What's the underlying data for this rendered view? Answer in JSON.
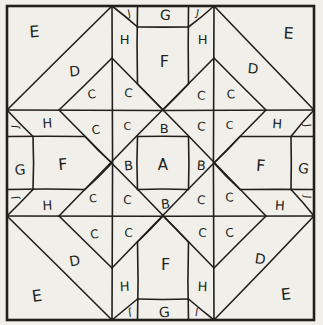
{
  "diagram": {
    "type": "quilt-block-piecing-diagram",
    "letters_used": [
      "A",
      "B",
      "C",
      "D",
      "E",
      "F",
      "G",
      "H",
      "J"
    ],
    "colors": {
      "paper": "#f1efe9",
      "ink": "#211f1c"
    },
    "stroke": {
      "border_width": 2.6,
      "line_width": 1.6
    },
    "grid": {
      "x": [
        7,
        33,
        59,
        85,
        112,
        137.5,
        163,
        188.5,
        214,
        240,
        266,
        291,
        314
      ],
      "y": [
        6,
        27,
        58,
        84,
        110,
        136.5,
        163,
        189.5,
        216,
        242,
        268,
        299,
        320
      ]
    },
    "segments": [
      [
        4,
        0,
        4,
        12
      ],
      [
        8,
        0,
        8,
        12
      ],
      [
        0,
        4,
        12,
        4
      ],
      [
        0,
        8,
        12,
        8
      ],
      [
        4,
        0,
        0,
        4
      ],
      [
        8,
        0,
        12,
        4
      ],
      [
        0,
        8,
        4,
        12
      ],
      [
        12,
        8,
        8,
        12
      ],
      [
        4,
        2,
        10,
        8
      ],
      [
        2,
        4,
        8,
        10
      ],
      [
        8,
        2,
        2,
        8
      ],
      [
        10,
        4,
        4,
        10
      ],
      [
        2,
        4,
        4,
        2
      ],
      [
        8,
        2,
        10,
        4
      ],
      [
        2,
        8,
        4,
        10
      ],
      [
        8,
        10,
        10,
        8
      ],
      [
        5,
        5,
        7,
        5
      ],
      [
        7,
        5,
        7,
        7
      ],
      [
        5,
        7,
        7,
        7
      ],
      [
        5,
        5,
        5,
        7
      ],
      [
        5,
        0,
        5,
        3
      ],
      [
        7,
        0,
        7,
        3
      ],
      [
        5,
        1,
        7,
        1
      ],
      [
        5,
        3,
        6,
        4
      ],
      [
        7,
        3,
        6,
        4
      ],
      [
        4,
        0,
        5,
        1
      ],
      [
        8,
        0,
        7,
        1
      ],
      [
        5,
        9,
        5,
        12
      ],
      [
        7,
        9,
        7,
        12
      ],
      [
        5,
        11,
        7,
        11
      ],
      [
        5,
        9,
        6,
        8
      ],
      [
        7,
        9,
        6,
        8
      ],
      [
        4,
        12,
        5,
        11
      ],
      [
        8,
        12,
        7,
        11
      ],
      [
        0,
        5,
        3,
        5
      ],
      [
        0,
        7,
        3,
        7
      ],
      [
        1,
        5,
        1,
        7
      ],
      [
        3,
        5,
        4,
        6
      ],
      [
        3,
        7,
        4,
        6
      ],
      [
        0,
        4,
        1,
        5
      ],
      [
        0,
        8,
        1,
        7
      ],
      [
        9,
        5,
        12,
        5
      ],
      [
        9,
        7,
        12,
        7
      ],
      [
        11,
        5,
        11,
        7
      ],
      [
        9,
        5,
        8,
        6
      ],
      [
        9,
        7,
        8,
        6
      ],
      [
        12,
        4,
        11,
        5
      ],
      [
        12,
        8,
        11,
        7
      ]
    ],
    "labels": [
      {
        "t": "E",
        "x": 1.05,
        "y": 1.15,
        "s": 16,
        "r": -4
      },
      {
        "t": "E",
        "x": 10.9,
        "y": 1.2,
        "s": 16,
        "r": 3
      },
      {
        "t": "E",
        "x": 1.15,
        "y": 10.9,
        "s": 16,
        "r": -8
      },
      {
        "t": "E",
        "x": 10.8,
        "y": 10.85,
        "s": 16,
        "r": -6
      },
      {
        "t": "D",
        "x": 2.6,
        "y": 2.5,
        "s": 14,
        "r": -5
      },
      {
        "t": "D",
        "x": 9.5,
        "y": 2.4,
        "s": 14,
        "r": 5
      },
      {
        "t": "D",
        "x": 2.6,
        "y": 9.72,
        "s": 14,
        "r": -10
      },
      {
        "t": "D",
        "x": 9.78,
        "y": 9.65,
        "s": 14,
        "r": 8
      },
      {
        "t": "C",
        "x": 3.25,
        "y": 3.4,
        "s": 12,
        "r": -6
      },
      {
        "t": "C",
        "x": 4.65,
        "y": 3.35,
        "s": 12,
        "r": 4
      },
      {
        "t": "C",
        "x": 3.4,
        "y": 4.75,
        "s": 12,
        "r": -8
      },
      {
        "t": "C",
        "x": 4.6,
        "y": 4.62,
        "s": 11,
        "r": 0
      },
      {
        "t": "C",
        "x": 7.5,
        "y": 3.45,
        "s": 12,
        "r": 5
      },
      {
        "t": "C",
        "x": 8.65,
        "y": 3.4,
        "s": 12,
        "r": -4
      },
      {
        "t": "C",
        "x": 7.5,
        "y": 4.62,
        "s": 12,
        "r": 6
      },
      {
        "t": "C",
        "x": 8.6,
        "y": 4.6,
        "s": 11,
        "r": 0
      },
      {
        "t": "C",
        "x": 3.3,
        "y": 7.35,
        "s": 11,
        "r": -5
      },
      {
        "t": "C",
        "x": 4.6,
        "y": 7.4,
        "s": 12,
        "r": 3
      },
      {
        "t": "C",
        "x": 3.35,
        "y": 8.7,
        "s": 12,
        "r": -7
      },
      {
        "t": "C",
        "x": 4.65,
        "y": 8.65,
        "s": 12,
        "r": 2
      },
      {
        "t": "C",
        "x": 7.5,
        "y": 7.4,
        "s": 12,
        "r": 4
      },
      {
        "t": "C",
        "x": 8.6,
        "y": 7.3,
        "s": 12,
        "r": -3
      },
      {
        "t": "C",
        "x": 7.55,
        "y": 8.65,
        "s": 12,
        "r": 5
      },
      {
        "t": "C",
        "x": 8.6,
        "y": 8.65,
        "s": 12,
        "r": -5
      },
      {
        "t": "B",
        "x": 6.05,
        "y": 4.68,
        "s": 13,
        "r": 0
      },
      {
        "t": "B",
        "x": 4.65,
        "y": 6.1,
        "s": 13,
        "r": -5
      },
      {
        "t": "B",
        "x": 7.5,
        "y": 6.1,
        "s": 13,
        "r": 4
      },
      {
        "t": "B",
        "x": 6.1,
        "y": 7.55,
        "s": 13,
        "r": -6
      },
      {
        "t": "A",
        "x": 6.0,
        "y": 6.08,
        "s": 15,
        "r": 0
      },
      {
        "t": "F",
        "x": 6.05,
        "y": 2.15,
        "s": 16,
        "r": 0
      },
      {
        "t": "F",
        "x": 2.15,
        "y": 6.05,
        "s": 16,
        "r": -5
      },
      {
        "t": "F",
        "x": 9.8,
        "y": 6.1,
        "s": 16,
        "r": 4
      },
      {
        "t": "F",
        "x": 6.1,
        "y": 9.85,
        "s": 16,
        "r": 0
      },
      {
        "t": "G",
        "x": 6.1,
        "y": 0.42,
        "s": 14,
        "r": 6
      },
      {
        "t": "G",
        "x": 0.5,
        "y": 6.25,
        "s": 14,
        "r": -4
      },
      {
        "t": "G",
        "x": 11.55,
        "y": 6.2,
        "s": 14,
        "r": 8
      },
      {
        "t": "G",
        "x": 6.05,
        "y": 11.62,
        "s": 14,
        "r": -4
      },
      {
        "t": "H",
        "x": 4.5,
        "y": 1.4,
        "s": 13,
        "r": 0
      },
      {
        "t": "H",
        "x": 7.55,
        "y": 1.4,
        "s": 13,
        "r": 0
      },
      {
        "t": "H",
        "x": 1.55,
        "y": 4.5,
        "s": 13,
        "r": -4
      },
      {
        "t": "H",
        "x": 10.45,
        "y": 4.52,
        "s": 13,
        "r": 4
      },
      {
        "t": "H",
        "x": 1.55,
        "y": 7.6,
        "s": 13,
        "r": -3
      },
      {
        "t": "H",
        "x": 10.55,
        "y": 7.6,
        "s": 13,
        "r": 3
      },
      {
        "t": "H",
        "x": 4.5,
        "y": 10.6,
        "s": 13,
        "r": -3
      },
      {
        "t": "H",
        "x": 7.55,
        "y": 10.6,
        "s": 13,
        "r": 2
      },
      {
        "t": "J",
        "x": 4.67,
        "y": 0.33,
        "s": 10,
        "r": -12
      },
      {
        "t": "J",
        "x": 7.36,
        "y": 0.33,
        "s": 10,
        "r": 10
      },
      {
        "t": "J",
        "x": 0.3,
        "y": 4.62,
        "s": 10,
        "r": -85
      },
      {
        "t": "J",
        "x": 0.3,
        "y": 7.3,
        "s": 10,
        "r": -95
      },
      {
        "t": "J",
        "x": 11.72,
        "y": 4.58,
        "s": 10,
        "r": 85
      },
      {
        "t": "J",
        "x": 11.72,
        "y": 7.28,
        "s": 10,
        "r": 95
      },
      {
        "t": "J",
        "x": 4.7,
        "y": 11.67,
        "s": 10,
        "r": 172
      },
      {
        "t": "J",
        "x": 7.32,
        "y": 11.64,
        "s": 10,
        "r": 188
      }
    ]
  }
}
